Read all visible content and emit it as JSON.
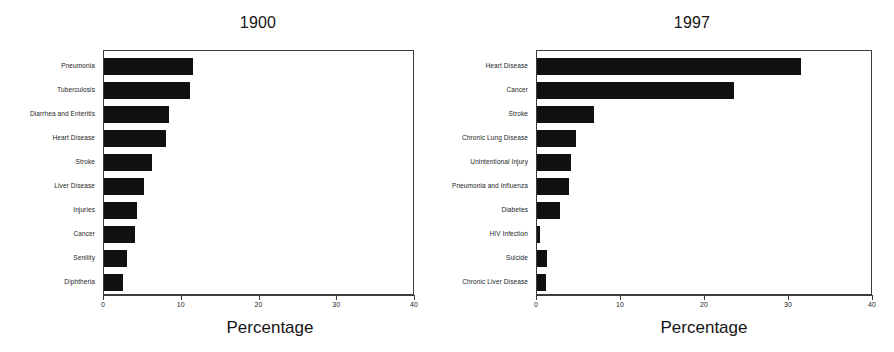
{
  "figure": {
    "background_color": "#ffffff",
    "bar_color": "#111111",
    "axis_color": "#3c3c3c"
  },
  "chart_data": [
    {
      "type": "bar",
      "orientation": "horizontal",
      "title": "1900",
      "xlabel": "Percentage",
      "ylabel": "",
      "xlim": [
        0,
        40
      ],
      "xticks": [
        0,
        10,
        20,
        30,
        40
      ],
      "xtick_labels": [
        "0",
        "10",
        "20",
        "30",
        "40"
      ],
      "grid": false,
      "legend": false,
      "categories": [
        "Pneumonia",
        "Tuberculosis",
        "Diarrhea and Enteritis",
        "Heart Disease",
        "Stroke",
        "Liver Disease",
        "Injuries",
        "Cancer",
        "Senility",
        "Diphtheria"
      ],
      "values": [
        11.4,
        11.1,
        8.3,
        8.0,
        6.2,
        5.1,
        4.2,
        4.0,
        3.0,
        2.4
      ]
    },
    {
      "type": "bar",
      "orientation": "horizontal",
      "title": "1997",
      "xlabel": "Percentage",
      "ylabel": "",
      "xlim": [
        0,
        40
      ],
      "xticks": [
        0,
        10,
        20,
        30,
        40
      ],
      "xtick_labels": [
        "0",
        "10",
        "20",
        "30",
        "40"
      ],
      "grid": false,
      "legend": false,
      "categories": [
        "Heart Disease",
        "Cancer",
        "Stroke",
        "Chronic Lung Disease",
        "Unintentional Injury",
        "Pneumonia and Influenza",
        "Diabetes",
        "HIV Infection",
        "Suicide",
        "Chronic Liver Disease"
      ],
      "values": [
        31.4,
        23.4,
        6.8,
        4.7,
        4.0,
        3.8,
        2.7,
        0.4,
        1.2,
        1.1
      ]
    }
  ]
}
